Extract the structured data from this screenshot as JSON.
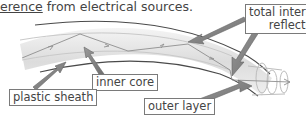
{
  "caption": {
    "underlined": "erence",
    "rest": " from electrical sources."
  },
  "diagram": {
    "labels": {
      "total_internal_reflection_line1": "total internal",
      "total_internal_reflection_line2": "reflection",
      "inner_core": "inner core",
      "plastic_sheath": "plastic sheath",
      "outer_layer": "outer layer"
    },
    "colors": {
      "arrow": "#8a8a8a",
      "fibre_edge": "#555555",
      "fibre_fill": "#e8e8e8",
      "light_ray": "#8f8f8f"
    }
  }
}
